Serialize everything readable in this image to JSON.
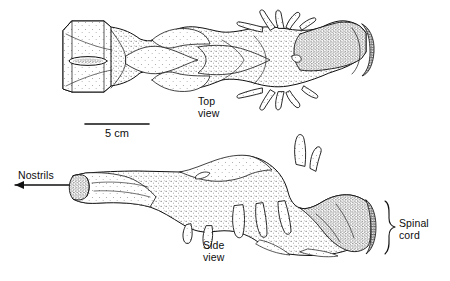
{
  "figure": {
    "kind": "scientific-illustration",
    "technique": "stipple-and-line-drawing",
    "background_color": "#ffffff",
    "ink_color": "#111111",
    "views": [
      {
        "id": "top",
        "label": "Top\nview"
      },
      {
        "id": "side",
        "label": "Side\nview"
      }
    ],
    "annotations": [
      {
        "id": "nostrils",
        "label": "Nostrils",
        "marker": "arrow-left"
      },
      {
        "id": "spinal_cord",
        "label": "Spinal\ncord",
        "marker": "curly-brace"
      }
    ],
    "scale_bar": {
      "label": "5 cm",
      "length_px": 64,
      "unit": "cm",
      "value": 5
    }
  }
}
